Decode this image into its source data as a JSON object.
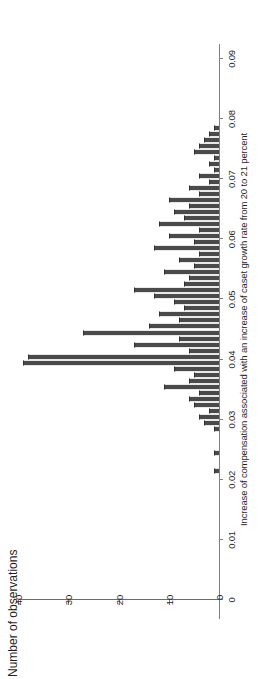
{
  "chart_data": {
    "type": "bar",
    "title": "",
    "subtitle": "",
    "xlabel": "Increase of compensation associated with an increase of caset growth rate from 20 to 21 percent",
    "ylabel": "Number of observations",
    "xlim": [
      0,
      0.09
    ],
    "ylim": [
      0,
      42
    ],
    "grid": false,
    "legend": null,
    "orientation": "rotated-90-ccw",
    "bin_width": 0.001,
    "bar_color": "#4a4a4a",
    "axis_color": "#808080",
    "xticks": [
      0,
      0.01,
      0.02,
      0.03,
      0.04,
      0.05,
      0.06,
      0.07,
      0.08,
      0.09
    ],
    "xtick_labels": [
      "0",
      "0.01",
      "0.02",
      "0.03",
      "0.04",
      "0.05",
      "0.06",
      "0.07",
      "0.08",
      "0.09"
    ],
    "yticks": [
      0,
      10,
      20,
      30,
      40
    ],
    "ytick_labels": [
      "0",
      "10",
      "20",
      "30",
      "40"
    ],
    "bins": [
      {
        "x": 0.0215,
        "value": 1
      },
      {
        "x": 0.0225,
        "value": 0
      },
      {
        "x": 0.0235,
        "value": 0
      },
      {
        "x": 0.0245,
        "value": 1
      },
      {
        "x": 0.0255,
        "value": 0
      },
      {
        "x": 0.0265,
        "value": 0
      },
      {
        "x": 0.0275,
        "value": 0
      },
      {
        "x": 0.0285,
        "value": 1
      },
      {
        "x": 0.0295,
        "value": 3
      },
      {
        "x": 0.0305,
        "value": 4
      },
      {
        "x": 0.0315,
        "value": 2
      },
      {
        "x": 0.0325,
        "value": 5
      },
      {
        "x": 0.0335,
        "value": 6
      },
      {
        "x": 0.0345,
        "value": 4
      },
      {
        "x": 0.0355,
        "value": 11
      },
      {
        "x": 0.0365,
        "value": 6
      },
      {
        "x": 0.0375,
        "value": 5
      },
      {
        "x": 0.0385,
        "value": 9
      },
      {
        "x": 0.0395,
        "value": 39
      },
      {
        "x": 0.0405,
        "value": 38
      },
      {
        "x": 0.0415,
        "value": 6
      },
      {
        "x": 0.0425,
        "value": 17
      },
      {
        "x": 0.0435,
        "value": 8
      },
      {
        "x": 0.0445,
        "value": 27
      },
      {
        "x": 0.0455,
        "value": 14
      },
      {
        "x": 0.0465,
        "value": 8
      },
      {
        "x": 0.0475,
        "value": 12
      },
      {
        "x": 0.0485,
        "value": 7
      },
      {
        "x": 0.0495,
        "value": 9
      },
      {
        "x": 0.0505,
        "value": 13
      },
      {
        "x": 0.0515,
        "value": 17
      },
      {
        "x": 0.0525,
        "value": 7
      },
      {
        "x": 0.0535,
        "value": 6
      },
      {
        "x": 0.0545,
        "value": 11
      },
      {
        "x": 0.0555,
        "value": 5
      },
      {
        "x": 0.0565,
        "value": 8
      },
      {
        "x": 0.0575,
        "value": 4
      },
      {
        "x": 0.0585,
        "value": 13
      },
      {
        "x": 0.0595,
        "value": 5
      },
      {
        "x": 0.0605,
        "value": 10
      },
      {
        "x": 0.0615,
        "value": 4
      },
      {
        "x": 0.0625,
        "value": 12
      },
      {
        "x": 0.0635,
        "value": 7
      },
      {
        "x": 0.0645,
        "value": 9
      },
      {
        "x": 0.0655,
        "value": 6
      },
      {
        "x": 0.0665,
        "value": 10
      },
      {
        "x": 0.0675,
        "value": 4
      },
      {
        "x": 0.0685,
        "value": 6
      },
      {
        "x": 0.0695,
        "value": 2
      },
      {
        "x": 0.0705,
        "value": 4
      },
      {
        "x": 0.0715,
        "value": 1
      },
      {
        "x": 0.0725,
        "value": 2
      },
      {
        "x": 0.0735,
        "value": 1
      },
      {
        "x": 0.0745,
        "value": 5
      },
      {
        "x": 0.0755,
        "value": 4
      },
      {
        "x": 0.0765,
        "value": 3
      },
      {
        "x": 0.0775,
        "value": 2
      },
      {
        "x": 0.0785,
        "value": 1
      }
    ]
  }
}
